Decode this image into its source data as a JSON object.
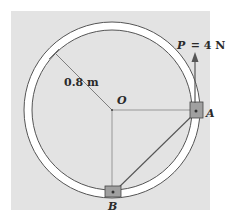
{
  "diagram": {
    "type": "mechanics-figure",
    "colors": {
      "panel": "#e3e3e3",
      "ring_fill": "#ffffff",
      "line": "#555555",
      "collar": "#9a9a9a",
      "text": "#2a2a2a"
    },
    "labels": {
      "radius": "0.8 m",
      "center": "O",
      "point_a": "A",
      "point_b": "B",
      "force_symbol": "P",
      "force_eq": "= 4 N"
    },
    "elements": [
      {
        "id": "circular-ring-guide",
        "desc": "circular ring rod, radius 0.8 m, center O"
      },
      {
        "id": "collar-a",
        "desc": "collar at A on the right of the ring"
      },
      {
        "id": "collar-b",
        "desc": "collar at B on the bottom of the ring"
      },
      {
        "id": "force-p",
        "desc": "vertical upward force P = 4 N applied at A"
      },
      {
        "id": "cord-ab",
        "desc": "straight line connecting A and B"
      },
      {
        "id": "radius-line",
        "desc": "radius dimension line from O to upper-left of ring"
      }
    ]
  }
}
